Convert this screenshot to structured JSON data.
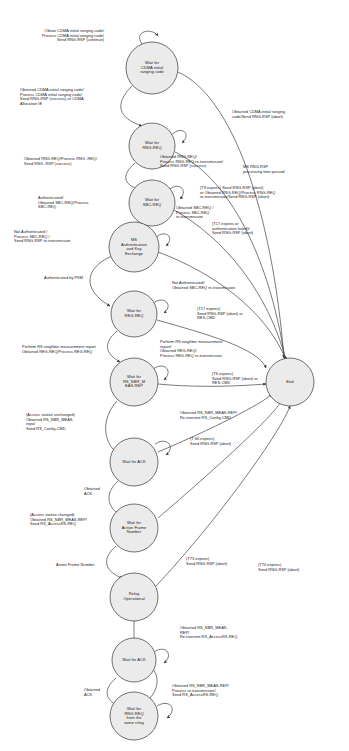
{
  "diagram": {
    "type": "state-machine",
    "background_color": "#ffffff",
    "node_fill": "#ebebeb",
    "node_stroke": "#4d4d4d",
    "edge_color": "#4d4d4d"
  },
  "states": [
    {
      "id": "s1",
      "label": "Wait for\nCDMA initial\nranging code",
      "cx": 152,
      "cy": 68,
      "r": 26
    },
    {
      "id": "s2",
      "label": "Wait for\nRNG-REQ",
      "cx": 152,
      "cy": 146,
      "r": 23
    },
    {
      "id": "s3",
      "label": "Wait for\nSBC-REQ",
      "cx": 152,
      "cy": 203,
      "r": 23
    },
    {
      "id": "s4",
      "label": "MS\nAuthentication\nand Key\nExchange",
      "cx": 134,
      "cy": 247,
      "r": 25
    },
    {
      "id": "s5",
      "label": "Wait for\nREG-REQ",
      "cx": 134,
      "cy": 314,
      "r": 23
    },
    {
      "id": "s6",
      "label": "Wait for\nRS_NBR_M\nEAS-REP",
      "cx": 134,
      "cy": 382,
      "r": 24
    },
    {
      "id": "s7",
      "label": "Wait for ACK",
      "cx": 134,
      "cy": 462,
      "r": 24
    },
    {
      "id": "s8",
      "label": "Wait for\nAction Frame\nNumber",
      "cx": 134,
      "cy": 528,
      "r": 24
    },
    {
      "id": "s9",
      "label": "Relay\nOperational",
      "cx": 134,
      "cy": 597,
      "r": 24
    },
    {
      "id": "s10",
      "label": "Wait for ACK",
      "cx": 134,
      "cy": 660,
      "r": 22
    },
    {
      "id": "s11",
      "label": "Wait for\nRNG-REQ\nfrom the\nsame relay",
      "cx": 134,
      "cy": 716,
      "r": 24
    },
    {
      "id": "end",
      "label": "End",
      "cx": 290,
      "cy": 382,
      "r": 24
    }
  ],
  "edge_labels": [
    {
      "id": "l1",
      "text": "Obtain CDMA initial ranging code/\nProcess CDMA initial ranging code/\nSend RNG-RSP (continue)",
      "x": 104,
      "y": 29,
      "align": "right"
    },
    {
      "id": "l2",
      "text": "Obtained CDMA initial ranging code/\nProcess CDMA initial ranging code/\nSend RNG-RSP (success) or CDMA\nAllocation IE",
      "x": 20,
      "y": 88,
      "align": "left"
    },
    {
      "id": "l3",
      "text": "Obtained CDMA initial ranging\ncode/Send RNG-RSP (abort)",
      "x": 232,
      "y": 110,
      "align": "left"
    },
    {
      "id": "l4",
      "text": "Obtained RNG-REQ/Process RNG -REQ/\nSend RNG -RSP (success)",
      "x": 24,
      "y": 157,
      "align": "left"
    },
    {
      "id": "l5",
      "text": "Obtained RNG-REQ/\nProcess RNG-REQ re-transmission/\nSend RNG-RSP (success)",
      "x": 160,
      "y": 155,
      "align": "left"
    },
    {
      "id": "l6",
      "text": "MS RNG-RSP\nprocessing time passed",
      "x": 243,
      "y": 165,
      "align": "left"
    },
    {
      "id": "l7",
      "text": "(T9 expires) Send RNG-RSP (abort)\nor Obtained RNG-REQ/Process RNG-REQ\nre-transmission/Send RNG-RSP (abort)",
      "x": 200,
      "y": 186,
      "align": "left"
    },
    {
      "id": "l8",
      "text": "Authenticated/\nObtained SBC-REQ/Process\nSBC-REQ",
      "x": 38,
      "y": 196,
      "align": "left"
    },
    {
      "id": "l9",
      "text": "Obtained SBC-REQ /\nProcess SBC-REQ\nre-transmission",
      "x": 176,
      "y": 206,
      "align": "left"
    },
    {
      "id": "l10",
      "text": "(T17 expires or\nauthentication failed)/\nSend RNG-RSP (abort)",
      "x": 212,
      "y": 222,
      "align": "left"
    },
    {
      "id": "l11",
      "text": "Not Authenticated /\nProcess SBC-REQ /\nSend RNG-RSP re-transmission",
      "x": 14,
      "y": 230,
      "align": "left"
    },
    {
      "id": "l12",
      "text": "Authenticated by PKM",
      "x": 44,
      "y": 276,
      "align": "left"
    },
    {
      "id": "l13",
      "text": "Not Authenticated/\nObtained SBC-REQ re-transmission",
      "x": 172,
      "y": 281,
      "align": "left"
    },
    {
      "id": "l14",
      "text": "(T17 expires)\nSend RNG-RSP (abort) or\nRES-CMD",
      "x": 197,
      "y": 307,
      "align": "left"
    },
    {
      "id": "l15",
      "text": "Perform RS neighbor measurement report\nObtained REG-REQ/Process REG-REQ",
      "x": 22,
      "y": 345,
      "align": "left"
    },
    {
      "id": "l16",
      "text": "Perform RS neighbor measurement\nreport/\nObtained REG-REQ/\nProcess REG-REQ re-transmission",
      "x": 160,
      "y": 340,
      "align": "left"
    },
    {
      "id": "l17",
      "text": "(T6 expires)\nSend RNG-RSP (abort) or\nRES-CMD",
      "x": 212,
      "y": 372,
      "align": "left"
    },
    {
      "id": "l18",
      "text": "Obtained RS_NBR_MEAS-REP/\nRe-transmit RS_Config-CMD",
      "x": 180,
      "y": 411,
      "align": "left"
    },
    {
      "id": "l19",
      "text": "(Access station unchanged)\nObtained RS_NBR_MEAS-\nrepo/\nSend RS_Config-CMD",
      "x": 26,
      "y": 413,
      "align": "left"
    },
    {
      "id": "l20",
      "text": "(T 66 expires)\nSend RNG-RSP (abort)",
      "x": 190,
      "y": 437,
      "align": "left"
    },
    {
      "id": "l21",
      "text": "Obtained\nACK",
      "x": 84,
      "y": 487,
      "align": "left"
    },
    {
      "id": "l22",
      "text": "(Access station changed)\nObtained RS_NBR_MEAS-REP/\nSend RS_AccessRS-REQ",
      "x": 30,
      "y": 513,
      "align": "left"
    },
    {
      "id": "l23",
      "text": "Action Frame Number",
      "x": 56,
      "y": 563,
      "align": "left"
    },
    {
      "id": "l24",
      "text": "(T73 expires)\nSend RNG-RSP (abort)",
      "x": 186,
      "y": 557,
      "align": "left"
    },
    {
      "id": "l25",
      "text": "(T70 expires)\nSend RNG-RSP (abort)",
      "x": 258,
      "y": 563,
      "align": "left"
    },
    {
      "id": "l26",
      "text": "Obtained RS_NBR_MEAS-\nREP/\nRe-transmit RS_AccessRS-REQ",
      "x": 180,
      "y": 626,
      "align": "left"
    },
    {
      "id": "l27",
      "text": "Obtained\nACK",
      "x": 84,
      "y": 688,
      "align": "left"
    },
    {
      "id": "l28",
      "text": "Obtained RS_NBR_MEAS-REP/\nProcess re-transmission/\nSend RS_AccessRS-REQ",
      "x": 172,
      "y": 684,
      "align": "left"
    }
  ]
}
